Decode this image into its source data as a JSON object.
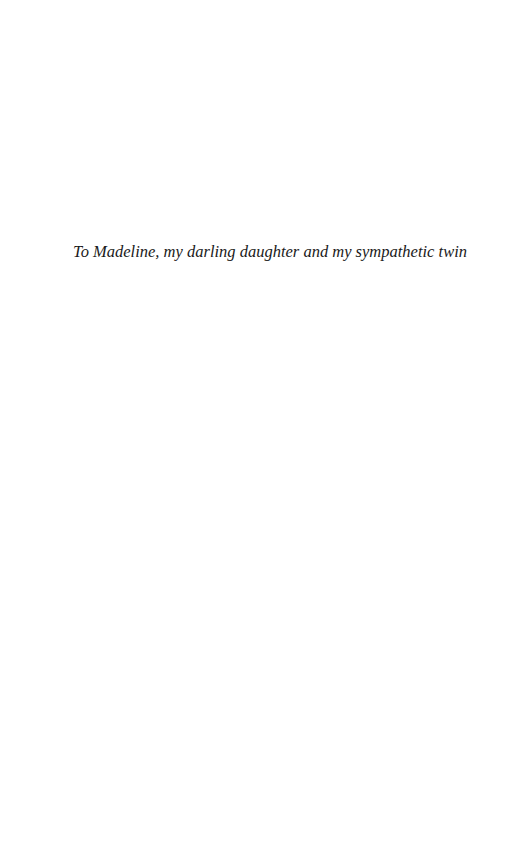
{
  "page": {
    "dedication": "To Madeline, my darling daughter and my sympathetic twin"
  }
}
